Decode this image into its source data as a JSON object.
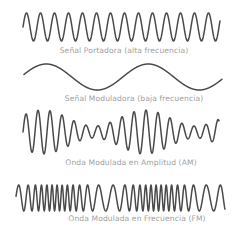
{
  "diagram": {
    "colors": {
      "background": "#ffffff",
      "line": "#4a4a4a",
      "label": "#a0a0a0"
    },
    "waves": [
      {
        "id": "carrier",
        "label": "Señal Portadora (alta frecuencia)",
        "type": "carrier",
        "x_start": 23,
        "x_end": 220,
        "center_y": 27,
        "amplitude": 14,
        "period_px": 14,
        "label_x": 124,
        "label_y": 46
      },
      {
        "id": "modulating",
        "label": "Señal Moduladora (baja frecuencia)",
        "type": "modulating",
        "x_start": 24,
        "x_end": 222,
        "center_y": 77,
        "amplitude": 13,
        "period_px": 102,
        "label_x": 134,
        "label_y": 94
      },
      {
        "id": "am",
        "label": "Onda Modulada en Amplitud (AM)",
        "type": "am",
        "x_start": 23,
        "x_end": 219,
        "center_y": 132,
        "amplitude_max": 22,
        "amplitude_min": 6,
        "period_px": 12,
        "envelope_period_px": 102,
        "label_x": 131,
        "label_y": 158
      },
      {
        "id": "fm",
        "label": "Onda Modulada en Frecuencia (FM)",
        "type": "fm",
        "x_start": 16,
        "x_end": 225,
        "center_y": 198,
        "amplitude": 13,
        "period_min_px": 5,
        "period_max_px": 15,
        "label_x": 137,
        "label_y": 214
      }
    ]
  }
}
